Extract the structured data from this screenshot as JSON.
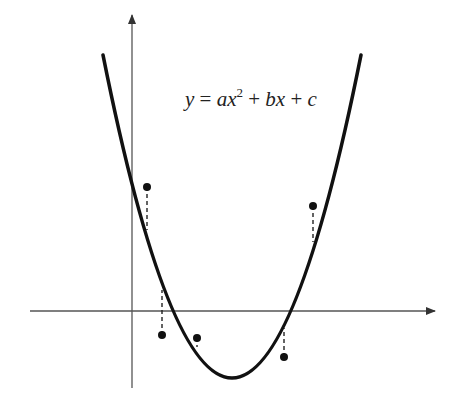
{
  "diagram": {
    "equation": {
      "y": "y",
      "eq": " = ",
      "a": "a",
      "x1": "x",
      "exp": "2",
      "plus1": " + ",
      "b": "b",
      "x2": "x",
      "plus2": " + ",
      "c": "c"
    },
    "colors": {
      "curve": "#111111",
      "axis": "#555555",
      "points": "#111111",
      "background": "#ffffff"
    },
    "points": [
      {
        "x": 147,
        "y": 187,
        "curve_y": 230
      },
      {
        "x": 162,
        "y": 335,
        "curve_y": 290
      },
      {
        "x": 197,
        "y": 338,
        "curve_y": 346
      },
      {
        "x": 284,
        "y": 357,
        "curve_y": 328
      },
      {
        "x": 313,
        "y": 206,
        "curve_y": 242
      }
    ]
  }
}
